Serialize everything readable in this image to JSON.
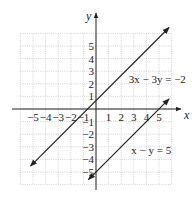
{
  "chart_data": {
    "type": "line",
    "title": "",
    "xlabel": "x",
    "ylabel": "y",
    "xlim": [
      -6,
      6
    ],
    "ylim": [
      -6,
      6
    ],
    "grid": true,
    "x_ticks": [
      -5,
      -4,
      -3,
      -2,
      -1,
      1,
      2,
      3,
      4,
      5
    ],
    "y_ticks": [
      -5,
      -4,
      -3,
      -2,
      -1,
      1,
      2,
      3,
      4,
      5
    ],
    "x_tick_labels": [
      "−5",
      "−4",
      "−3",
      "−2",
      "−1",
      "1",
      "2",
      "3",
      "4",
      "5"
    ],
    "y_tick_labels": [
      "−5",
      "−4",
      "−3",
      "−2",
      "−1",
      "1",
      "2",
      "3",
      "4",
      "5"
    ],
    "series": [
      {
        "name": "3x − 3y = −2",
        "equation": "y = x + 2/3",
        "x": [
          -5.2,
          5.8
        ],
        "y": [
          -4.53,
          6.47
        ],
        "arrows": "both"
      },
      {
        "name": "x − y = 5",
        "equation": "y = x − 5",
        "x": [
          -0.6,
          5.8
        ],
        "y": [
          -5.6,
          0.8
        ],
        "arrows": "both"
      }
    ],
    "annotations": [
      {
        "text": "3x − 3y = −2",
        "x": 2.6,
        "y": 2.1
      },
      {
        "text": "x − y = 5",
        "x": 2.8,
        "y": -3.6
      }
    ],
    "legend": null
  }
}
